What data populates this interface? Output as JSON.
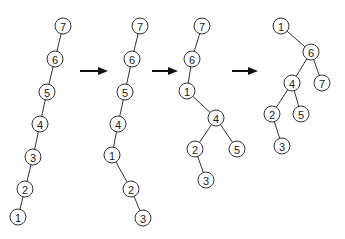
{
  "diagram": {
    "node_radius": 8,
    "colors": {
      "stroke": "#333333",
      "fill": "#ffffff",
      "arrow": "#111111"
    },
    "trees": [
      {
        "id": "tree-1",
        "nodes": [
          {
            "label": "7",
            "x": 63,
            "y": 26
          },
          {
            "label": "6",
            "x": 55,
            "y": 59
          },
          {
            "label": "5",
            "x": 47,
            "y": 92
          },
          {
            "label": "4",
            "x": 40,
            "y": 124
          },
          {
            "label": "3",
            "x": 33,
            "y": 157
          },
          {
            "label": "2",
            "x": 25,
            "y": 189
          },
          {
            "label": "1",
            "x": 18,
            "y": 217
          }
        ],
        "edges": [
          [
            "7",
            "6"
          ],
          [
            "6",
            "5"
          ],
          [
            "5",
            "4"
          ],
          [
            "4",
            "3"
          ],
          [
            "3",
            "2"
          ],
          [
            "2",
            "1"
          ]
        ]
      },
      {
        "id": "tree-2",
        "nodes": [
          {
            "label": "7",
            "x": 140,
            "y": 26
          },
          {
            "label": "6",
            "x": 132,
            "y": 59
          },
          {
            "label": "5",
            "x": 125,
            "y": 92
          },
          {
            "label": "4",
            "x": 118,
            "y": 124
          },
          {
            "label": "1",
            "x": 112,
            "y": 155
          },
          {
            "label": "2",
            "x": 131,
            "y": 189
          },
          {
            "label": "3",
            "x": 143,
            "y": 218
          }
        ],
        "edges": [
          [
            "7",
            "6"
          ],
          [
            "6",
            "5"
          ],
          [
            "5",
            "4"
          ],
          [
            "4",
            "1"
          ],
          [
            "1",
            "2"
          ],
          [
            "2",
            "3"
          ]
        ]
      },
      {
        "id": "tree-3",
        "nodes": [
          {
            "label": "7",
            "x": 202,
            "y": 26
          },
          {
            "label": "6",
            "x": 192,
            "y": 59
          },
          {
            "label": "1",
            "x": 187,
            "y": 91
          },
          {
            "label": "4",
            "x": 216,
            "y": 118
          },
          {
            "label": "2",
            "x": 195,
            "y": 149
          },
          {
            "label": "5",
            "x": 237,
            "y": 149
          },
          {
            "label": "3",
            "x": 206,
            "y": 180
          }
        ],
        "edges": [
          [
            "7",
            "6"
          ],
          [
            "6",
            "1"
          ],
          [
            "1",
            "4"
          ],
          [
            "4",
            "2"
          ],
          [
            "4",
            "5"
          ],
          [
            "2",
            "3"
          ]
        ]
      },
      {
        "id": "tree-4",
        "nodes": [
          {
            "label": "1",
            "x": 281,
            "y": 26
          },
          {
            "label": "6",
            "x": 311,
            "y": 52
          },
          {
            "label": "4",
            "x": 292,
            "y": 83
          },
          {
            "label": "7",
            "x": 322,
            "y": 83
          },
          {
            "label": "2",
            "x": 272,
            "y": 114
          },
          {
            "label": "5",
            "x": 301,
            "y": 114
          },
          {
            "label": "3",
            "x": 282,
            "y": 146
          }
        ],
        "edges": [
          [
            "1",
            "6"
          ],
          [
            "6",
            "4"
          ],
          [
            "6",
            "7"
          ],
          [
            "4",
            "2"
          ],
          [
            "4",
            "5"
          ],
          [
            "2",
            "3"
          ]
        ]
      }
    ],
    "arrows": [
      {
        "x1": 80,
        "x2": 108,
        "y": 71
      },
      {
        "x1": 152,
        "x2": 178,
        "y": 71
      },
      {
        "x1": 232,
        "x2": 258,
        "y": 71
      }
    ]
  }
}
